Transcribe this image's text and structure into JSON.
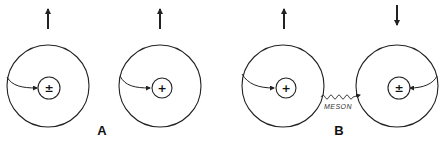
{
  "diagram": {
    "colors": {
      "stroke": "#222222",
      "background": "#ffffff"
    },
    "panels": [
      {
        "label": "A",
        "atoms": [
          {
            "id": "atom-1",
            "spin": "up",
            "nucleus_charge": "±",
            "electron_path_from": "left"
          },
          {
            "id": "atom-2",
            "spin": "up",
            "nucleus_charge": "+",
            "electron_path_from": "left"
          }
        ]
      },
      {
        "label": "B",
        "atoms": [
          {
            "id": "atom-3",
            "spin": "up",
            "nucleus_charge": "+",
            "electron_path_from": "left"
          },
          {
            "id": "atom-4",
            "spin": "down",
            "nucleus_charge": "±",
            "electron_path_from": "right"
          }
        ],
        "exchange": {
          "label": "MESON",
          "style": "wavy-arrow",
          "direction": "left-to-right"
        }
      }
    ]
  }
}
